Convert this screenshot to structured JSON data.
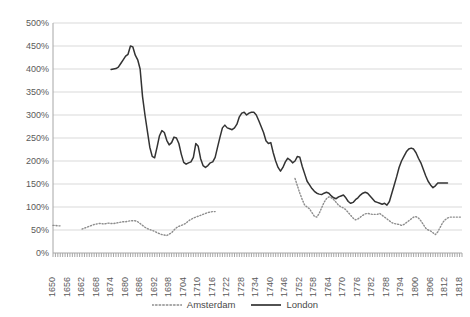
{
  "chart_data": {
    "type": "line",
    "title": "",
    "xlabel": "",
    "ylabel": "",
    "ylim": [
      0,
      500
    ],
    "ytick_labels": [
      "0%",
      "50%",
      "100%",
      "150%",
      "200%",
      "250%",
      "300%",
      "350%",
      "400%",
      "450%",
      "500%"
    ],
    "ytick_values": [
      0,
      50,
      100,
      150,
      200,
      250,
      300,
      350,
      400,
      450,
      500
    ],
    "xlim": [
      1650,
      1819
    ],
    "xtick_labels": [
      "1650",
      "1656",
      "1662",
      "1668",
      "1674",
      "1680",
      "1686",
      "1692",
      "1698",
      "1704",
      "1710",
      "1716",
      "1722",
      "1728",
      "1734",
      "1740",
      "1746",
      "1752",
      "1758",
      "1764",
      "1770",
      "1776",
      "1782",
      "1788",
      "1794",
      "1800",
      "1806",
      "1812",
      "1818"
    ],
    "xtick_values": [
      1650,
      1656,
      1662,
      1668,
      1674,
      1680,
      1686,
      1692,
      1698,
      1704,
      1710,
      1716,
      1722,
      1728,
      1734,
      1740,
      1746,
      1752,
      1758,
      1764,
      1770,
      1776,
      1782,
      1788,
      1794,
      1800,
      1806,
      1812,
      1818
    ],
    "grid": true,
    "grid_axis": "y",
    "grid_color": "#d9d9d9",
    "axis_color": "#a6a6a6",
    "legend_position": "bottom",
    "series": [
      {
        "name": "Amsterdam",
        "color": "#8c8c8c",
        "style": "dotted",
        "segments": [
          {
            "x": [
              1650,
              1651,
              1652,
              1653
            ],
            "values": [
              60,
              60,
              59,
              59
            ]
          },
          {
            "x": [
              1662,
              1663,
              1664,
              1665,
              1666,
              1667,
              1668,
              1669,
              1670,
              1671,
              1672,
              1673,
              1674,
              1675,
              1676,
              1677,
              1678,
              1679,
              1680,
              1681,
              1682,
              1683,
              1684,
              1685,
              1686,
              1687,
              1688,
              1689,
              1690,
              1691,
              1692,
              1693,
              1694,
              1695,
              1696,
              1697,
              1698,
              1699,
              1700,
              1701,
              1702,
              1703,
              1704,
              1705,
              1706,
              1707,
              1708,
              1709,
              1710,
              1711,
              1712,
              1713,
              1714,
              1715,
              1716,
              1717
            ],
            "values": [
              52,
              54,
              56,
              58,
              60,
              62,
              63,
              64,
              64,
              63,
              64,
              65,
              64,
              64,
              65,
              66,
              67,
              68,
              68,
              69,
              70,
              70,
              70,
              68,
              64,
              60,
              56,
              53,
              51,
              49,
              47,
              44,
              42,
              40,
              39,
              38,
              41,
              44,
              50,
              55,
              58,
              60,
              62,
              65,
              70,
              73,
              76,
              78,
              80,
              82,
              84,
              86,
              88,
              89,
              90,
              90
            ]
          },
          {
            "x": [
              1750,
              1751,
              1752,
              1753,
              1754,
              1755,
              1756,
              1757,
              1758,
              1759,
              1760,
              1761,
              1762,
              1763,
              1764,
              1765,
              1766,
              1767,
              1768,
              1769,
              1770,
              1771,
              1772,
              1773,
              1774,
              1775,
              1776,
              1777,
              1778,
              1779,
              1780,
              1781,
              1782,
              1783,
              1784,
              1785,
              1786,
              1787,
              1788,
              1789,
              1790,
              1791,
              1792,
              1793,
              1794,
              1795,
              1796,
              1797,
              1798,
              1799,
              1800,
              1801,
              1802,
              1803,
              1804,
              1805,
              1806,
              1807,
              1808,
              1809,
              1810,
              1811,
              1812,
              1813,
              1814,
              1815,
              1816,
              1817,
              1818,
              1819
            ],
            "values": [
              162,
              146,
              130,
              116,
              104,
              100,
              96,
              88,
              80,
              78,
              86,
              98,
              110,
              118,
              122,
              120,
              116,
              110,
              104,
              100,
              98,
              94,
              88,
              82,
              76,
              72,
              74,
              78,
              82,
              85,
              86,
              85,
              84,
              84,
              84,
              86,
              82,
              78,
              74,
              70,
              66,
              64,
              63,
              62,
              60,
              62,
              66,
              70,
              74,
              78,
              79,
              76,
              70,
              62,
              54,
              50,
              48,
              44,
              40,
              46,
              56,
              66,
              72,
              76,
              78,
              78,
              78,
              78,
              78,
              78
            ]
          }
        ]
      },
      {
        "name": "London",
        "color": "#333333",
        "style": "solid",
        "segments": [
          {
            "x": [
              1674,
              1675,
              1676,
              1677,
              1678,
              1679,
              1680,
              1681,
              1682,
              1683,
              1684,
              1685,
              1686,
              1687,
              1688,
              1689,
              1690,
              1691,
              1692,
              1693,
              1694,
              1695,
              1696,
              1697,
              1698,
              1699,
              1700,
              1701,
              1702,
              1703,
              1704,
              1705,
              1706,
              1707,
              1708,
              1709,
              1710,
              1711,
              1712,
              1713,
              1714,
              1715,
              1716,
              1717,
              1718,
              1719,
              1720,
              1721,
              1722,
              1723,
              1724,
              1725,
              1726,
              1727,
              1728,
              1729,
              1730,
              1731,
              1732,
              1733,
              1734,
              1735,
              1736,
              1737,
              1738,
              1739,
              1740,
              1741,
              1742,
              1743,
              1744,
              1745,
              1746,
              1747,
              1748,
              1749,
              1750,
              1751,
              1752,
              1753,
              1754,
              1755,
              1756,
              1757,
              1758,
              1759,
              1760,
              1761,
              1762,
              1763,
              1764,
              1765,
              1766,
              1767,
              1768,
              1769,
              1770,
              1771,
              1772,
              1773,
              1774,
              1775,
              1776,
              1777,
              1778,
              1779,
              1780,
              1781,
              1782,
              1783,
              1784,
              1785,
              1786,
              1787,
              1788,
              1789,
              1790,
              1791,
              1792,
              1793,
              1794,
              1795,
              1796,
              1797,
              1798,
              1799,
              1800,
              1801,
              1802,
              1803,
              1804,
              1805,
              1806,
              1807,
              1808,
              1809,
              1810,
              1811,
              1812,
              1813,
              1814,
              1815,
              1816,
              1817,
              1818,
              1819
            ],
            "values": [
              399,
              400,
              401,
              404,
              412,
              420,
              428,
              432,
              450,
              448,
              430,
              420,
              400,
              340,
              300,
              265,
              230,
              210,
              207,
              230,
              255,
              266,
              262,
              245,
              235,
              240,
              252,
              250,
              238,
              215,
              197,
              193,
              196,
              198,
              208,
              238,
              232,
              205,
              190,
              186,
              190,
              196,
              198,
              208,
              230,
              252,
              272,
              278,
              272,
              270,
              268,
              272,
              280,
              296,
              304,
              306,
              300,
              304,
              306,
              306,
              300,
              288,
              275,
              262,
              244,
              238,
              240,
              218,
              200,
              186,
              178,
              186,
              198,
              206,
              202,
              196,
              200,
              210,
              208,
              188,
              172,
              156,
              148,
              140,
              134,
              130,
              128,
              127,
              130,
              132,
              130,
              124,
              120,
              118,
              122,
              124,
              126,
              120,
              112,
              108,
              110,
              116,
              120,
              126,
              130,
              132,
              130,
              124,
              118,
              112,
              110,
              108,
              106,
              108,
              104,
              112,
              130,
              148,
              166,
              186,
              200,
              210,
              220,
              226,
              228,
              226,
              218,
              206,
              196,
              182,
              168,
              156,
              148,
              142,
              146,
              152,
              152,
              152,
              152,
              152
            ]
          }
        ]
      }
    ]
  },
  "legend": {
    "items": [
      {
        "label": "Amsterdam"
      },
      {
        "label": "London"
      }
    ]
  }
}
